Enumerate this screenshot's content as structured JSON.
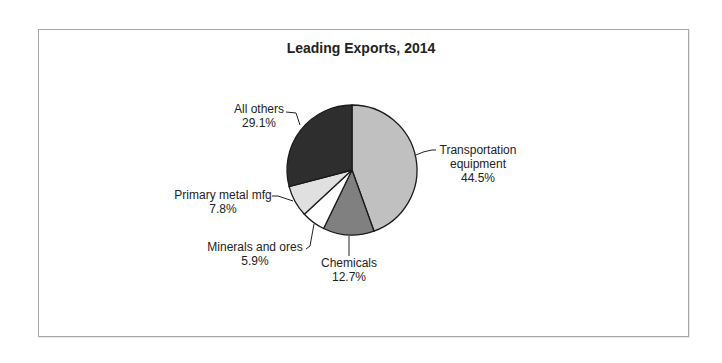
{
  "chart_data": {
    "type": "pie",
    "title": "Leading Exports, 2014",
    "categories": [
      "Transportation equipment",
      "Chemicals",
      "Minerals and ores",
      "Primary metal mfg",
      "All others"
    ],
    "values": [
      44.5,
      12.7,
      5.9,
      7.8,
      29.1
    ],
    "value_labels": [
      "44.5%",
      "12.7%",
      "5.9%",
      "7.8%",
      "29.1%"
    ],
    "colors": [
      "#c0c0c0",
      "#808080",
      "#ffffff",
      "#e0e0e0",
      "#2e2e2e"
    ],
    "start_angle": "12 o'clock, clockwise",
    "legend": "none (leader-line labels)"
  },
  "labels": {
    "transport_line1": "Transportation",
    "transport_line2": "equipment",
    "transport_pct": "44.5%",
    "chemicals": "Chemicals",
    "chemicals_pct": "12.7%",
    "minerals": "Minerals and ores",
    "minerals_pct": "5.9%",
    "metal": "Primary metal mfg",
    "metal_pct": "7.8%",
    "others": "All others",
    "others_pct": "29.1%"
  }
}
